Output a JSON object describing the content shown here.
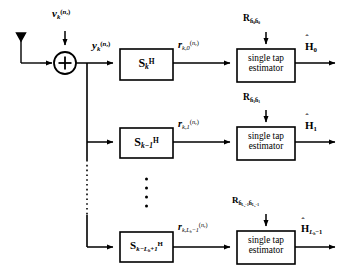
{
  "figure": {
    "type": "block-diagram",
    "background": "#ffffff",
    "stroke": "#000000"
  },
  "input_stage": {
    "antenna": {
      "icon": "antenna-icon",
      "label": ""
    },
    "adder": {
      "icon": "summation-circle-icon",
      "symbol": "+"
    },
    "noise_input": {
      "base": "v",
      "sub": "k",
      "sup": "(n_r)",
      "text": "v"
    },
    "bus_signal": {
      "base": "y",
      "sub": "k",
      "sup": "(n_r)",
      "text": "y"
    }
  },
  "rows": [
    {
      "id": "row-0",
      "matched_filter": {
        "base": "S",
        "sub": "k",
        "sup": "H"
      },
      "intermediate_signal": {
        "base": "r",
        "sub": "k,0",
        "sup": "(n_r)"
      },
      "estimator": {
        "line1": "single tap",
        "line2": "estimator"
      },
      "correlation_input": {
        "base": "R",
        "sub": "h̃0 h̃0"
      },
      "output": {
        "base": "H",
        "sub": "0",
        "accent": "hat"
      }
    },
    {
      "id": "row-1",
      "matched_filter": {
        "base": "S",
        "sub": "k−1",
        "sup": "H"
      },
      "intermediate_signal": {
        "base": "r",
        "sub": "k,1",
        "sup": "(n_r)"
      },
      "estimator": {
        "line1": "single tap",
        "line2": "estimator"
      },
      "correlation_input": {
        "base": "R",
        "sub": "h̃1 h̃1"
      },
      "output": {
        "base": "H",
        "sub": "1",
        "accent": "hat"
      }
    },
    {
      "id": "row-last",
      "matched_filter": {
        "base": "S",
        "sub": "k−L_h+1",
        "sup": "H"
      },
      "intermediate_signal": {
        "base": "r",
        "sub": "k,L_h−1",
        "sup": "(n_r)"
      },
      "estimator": {
        "line1": "single tap",
        "line2": "estimator"
      },
      "correlation_input": {
        "base": "R",
        "sub": "h̃_{L_h−1} h̃_{L_h−1}"
      },
      "output": {
        "base": "H",
        "sub": "L_h−1",
        "accent": "hat"
      }
    }
  ],
  "ellipsis": {
    "vertical_dots_between_rows": "⋮",
    "bus_dots": "⋮"
  },
  "estimator_label": {
    "line1": "single tap",
    "line2": "estimator"
  }
}
